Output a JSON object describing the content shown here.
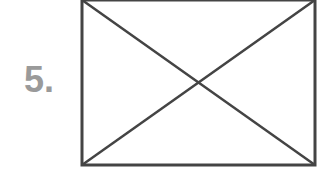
{
  "label": {
    "text": "5.",
    "color": "#9a9a9a"
  },
  "figure": {
    "shape": "rectangle-with-diagonals",
    "stroke_color": "#444444",
    "rect": {
      "x": 82,
      "y": 0,
      "width": 233,
      "height": 165
    }
  }
}
